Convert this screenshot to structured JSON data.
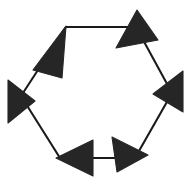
{
  "figure": {
    "type": "cycle-diagram",
    "shape": "hexagon",
    "node_count": 6,
    "direction": "counter-clockwise",
    "background_color": "#ffffff",
    "line_color": "#1a1a1a",
    "arrow_color": "#262626",
    "line_width": 2.1,
    "labels": [],
    "canvas": {
      "width": 192,
      "height": 183
    }
  },
  "geometry": {
    "vertices": [
      {
        "name": "top-left",
        "x": 66,
        "y": 27
      },
      {
        "name": "top-right",
        "x": 136,
        "y": 27
      },
      {
        "name": "right",
        "x": 172,
        "y": 93
      },
      {
        "name": "bottom-right",
        "x": 135,
        "y": 158
      },
      {
        "name": "bottom-left",
        "x": 60,
        "y": 158
      },
      {
        "name": "left",
        "x": 21,
        "y": 96
      }
    ],
    "edges": [
      {
        "name": "edge-top",
        "from": "top-left",
        "to": "top-right"
      },
      {
        "name": "edge-upper-right",
        "from": "top-right",
        "to": "right"
      },
      {
        "name": "edge-lower-right",
        "from": "right",
        "to": "bottom-right"
      },
      {
        "name": "edge-bottom",
        "from": "bottom-right",
        "to": "bottom-left"
      },
      {
        "name": "edge-lower-left",
        "from": "bottom-left",
        "to": "left"
      },
      {
        "name": "edge-upper-left",
        "from": "left",
        "to": "top-left"
      }
    ],
    "edge_paths": [
      "M 66 27 L 136 27",
      "M 136 27 L 172 93",
      "M 172 93 L 135 158",
      "M 135 158 L 60 158",
      "M 60 158 L 21 96",
      "M 21 96 L 66 27"
    ],
    "arrow_heads": [
      {
        "name": "arrow-top-left",
        "tip_x": 66,
        "tip_y": 26,
        "points": "66,26 33,70 62,78",
        "direction": "up-right",
        "at_vertex": "top-left"
      },
      {
        "name": "arrow-top-right",
        "tip_x": 137,
        "tip_y": 10,
        "points": "137,10 116,48 158,40",
        "direction": "up-right",
        "at_vertex": "top-right"
      },
      {
        "name": "arrow-right",
        "tip_x": 153,
        "tip_y": 94,
        "points": "153,94 183,71 183,112",
        "direction": "left",
        "at_vertex": "right"
      },
      {
        "name": "arrow-bottom-right",
        "tip_x": 148,
        "tip_y": 155,
        "points": "148,155 112,137 117,172",
        "direction": "down-right",
        "at_vertex": "bottom-right"
      },
      {
        "name": "arrow-bottom-left",
        "tip_x": 56,
        "tip_y": 158,
        "points": "56,158 93,140 93,176",
        "direction": "left",
        "at_vertex": "bottom-left"
      },
      {
        "name": "arrow-left",
        "tip_x": 35,
        "tip_y": 101,
        "points": "35,101 8,80 8,123",
        "direction": "right",
        "at_vertex": "left"
      }
    ]
  }
}
